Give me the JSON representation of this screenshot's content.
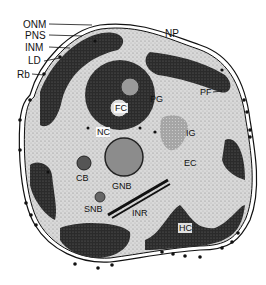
{
  "figure": {
    "title": "",
    "colors": {
      "background": "#ffffff",
      "cytoplasm": "#d6d6d6",
      "heterochromatin": "#2a2a2a",
      "membrane": "#111111",
      "ribosome": "#111111"
    },
    "external_labels": [
      {
        "id": "onm",
        "text": "ONM",
        "meaning": "outer nuclear membrane"
      },
      {
        "id": "pns",
        "text": "PNS",
        "meaning": "perinuclear space"
      },
      {
        "id": "inm",
        "text": "INM",
        "meaning": "inner nuclear membrane"
      },
      {
        "id": "ld",
        "text": "LD",
        "meaning": "lamina densa"
      },
      {
        "id": "rb",
        "text": "Rb",
        "meaning": "ribosome"
      },
      {
        "id": "np",
        "text": "NP",
        "meaning": "nuclear pore"
      }
    ],
    "internal_labels": [
      {
        "id": "pf",
        "text": "PF"
      },
      {
        "id": "fc",
        "text": "FC"
      },
      {
        "id": "pg",
        "text": "PG"
      },
      {
        "id": "nc",
        "text": "NC"
      },
      {
        "id": "ig",
        "text": "IG"
      },
      {
        "id": "ec",
        "text": "EC"
      },
      {
        "id": "cb",
        "text": "CB"
      },
      {
        "id": "gnb",
        "text": "GNB"
      },
      {
        "id": "snb",
        "text": "SNB"
      },
      {
        "id": "inr",
        "text": "INR"
      },
      {
        "id": "hc",
        "text": "HC"
      }
    ]
  }
}
